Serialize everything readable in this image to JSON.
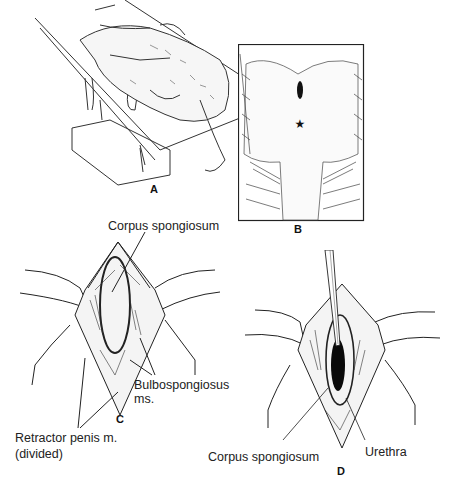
{
  "figure": {
    "panels": [
      {
        "id": "A",
        "label": "A",
        "description": "Animal positioned on surgical table, restrained"
      },
      {
        "id": "B",
        "label": "B",
        "description": "Perineal view with incision site marked by star"
      },
      {
        "id": "C",
        "label": "C",
        "description": "Exposed perineal dissection showing corpus spongiosum"
      },
      {
        "id": "D",
        "label": "D",
        "description": "Incision into urethra with instrument inserted"
      }
    ],
    "annotations": {
      "c_corpus_spongiosum": "Corpus spongiosum",
      "c_bulbospongiosus_1": "Bulbospongiosus",
      "c_bulbospongiosus_2": "ms.",
      "c_retractor_1": "Retractor penis m.",
      "c_retractor_2": "(divided)",
      "d_corpus_spongiosum": "Corpus spongiosum",
      "d_urethra": "Urethra"
    }
  }
}
